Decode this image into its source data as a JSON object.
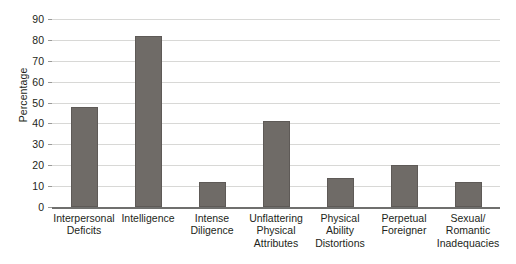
{
  "chart_data": {
    "type": "bar",
    "title": "",
    "subtitle": "",
    "xlabel": "",
    "ylabel": "Percentage",
    "ylim": [
      0,
      90
    ],
    "ytick_step": 10,
    "yticks": [
      0,
      10,
      20,
      30,
      40,
      50,
      60,
      70,
      80,
      90
    ],
    "grid": true,
    "legend": false,
    "legend_position": "none",
    "categories": [
      "Interpersonal Deficits",
      "Intelligence",
      "Intense Diligence",
      "Unflattering Physical Attributes",
      "Physical Ability Distortions",
      "Perpetual Foreigner",
      "Sexual/ Romantic Inadequacies"
    ],
    "category_lines": [
      [
        "Interpersonal",
        "Deficits"
      ],
      [
        "Intelligence"
      ],
      [
        "Intense",
        "Diligence"
      ],
      [
        "Unflattering",
        "Physical",
        "Attributes"
      ],
      [
        "Physical",
        "Ability",
        "Distortions"
      ],
      [
        "Perpetual",
        "Foreigner"
      ],
      [
        "Sexual/",
        "Romantic",
        "Inadequacies"
      ]
    ],
    "values": [
      48,
      82,
      12,
      41,
      14,
      20,
      12
    ],
    "series": [
      {
        "name": "Percentage",
        "values": [
          48,
          82,
          12,
          41,
          14,
          20,
          12
        ]
      }
    ]
  },
  "style": {
    "bar_color": "#6f6b67",
    "bar_border_color": "#5e5a57",
    "grid_color": "#d8d8d6",
    "axis_color": "#6f6f6d",
    "text_color": "#231f20",
    "background": "#ffffff"
  }
}
